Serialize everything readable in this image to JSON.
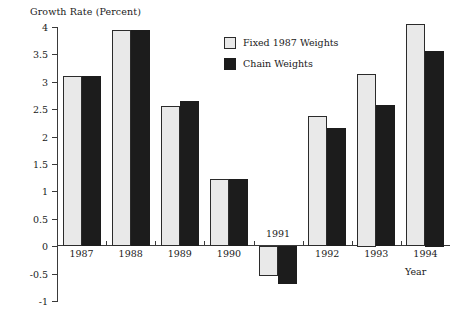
{
  "chart_data": {
    "type": "bar",
    "title": "",
    "xlabel": "Year",
    "ylabel": "Growth Rate (Percent)",
    "categories": [
      "1987",
      "1988",
      "1989",
      "1990",
      "1991",
      "1992",
      "1993",
      "1994"
    ],
    "series": [
      {
        "name": "Fixed 1987 Weights",
        "color": "#e9e9e9",
        "values": [
          3.1,
          3.95,
          2.55,
          1.22,
          -0.55,
          2.37,
          3.15,
          4.05
        ]
      },
      {
        "name": "Chain Weights",
        "color": "#1c1c1c",
        "values": [
          3.11,
          3.95,
          2.65,
          1.22,
          -0.7,
          2.15,
          2.57,
          3.57
        ]
      }
    ],
    "ylim": [
      -1,
      4
    ],
    "ytick_labels": [
      "4",
      "3.5",
      "3",
      "2.5",
      "2",
      "1.5",
      "1",
      "0.5",
      "0",
      "-0.5",
      "-1"
    ],
    "ytick_values": [
      4,
      3.5,
      3,
      2.5,
      2,
      1.5,
      1,
      0.5,
      0,
      -0.5,
      -1
    ],
    "grid": false,
    "legend_position": "top-center"
  }
}
